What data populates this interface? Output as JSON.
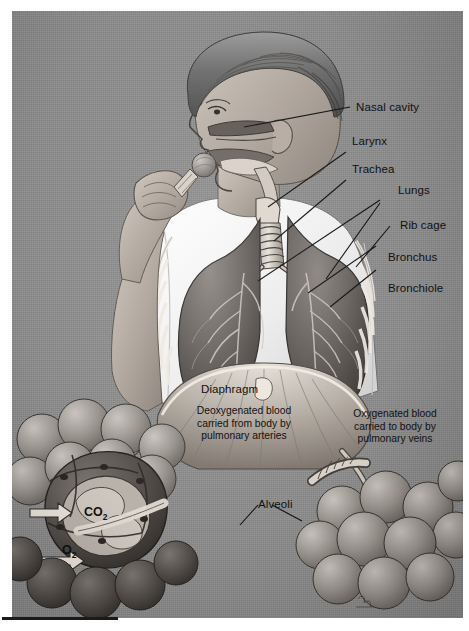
{
  "figure": {
    "background_color": "#8d8d8d",
    "ink_color": "#111111",
    "margin_color": "#ffffff"
  },
  "labels": [
    {
      "id": "nasal-cavity",
      "text": "Nasal cavity"
    },
    {
      "id": "larynx",
      "text": "Larynx"
    },
    {
      "id": "trachea",
      "text": "Trachea"
    },
    {
      "id": "lungs",
      "text": "Lungs"
    },
    {
      "id": "rib-cage",
      "text": "Rib cage"
    },
    {
      "id": "bronchus",
      "text": "Bronchus"
    },
    {
      "id": "bronchiole",
      "text": "Bronchiole"
    },
    {
      "id": "diaphragm",
      "text": "Diaphragm"
    },
    {
      "id": "alveoli",
      "text": "Alveoli"
    }
  ],
  "captions": {
    "deoxygenated": "Deoxygenated blood\ncarried from body by\npulmonary arteries",
    "oxygenated": "Oxygenated blood\ncarried to body by\npulmonary veins"
  },
  "gases": {
    "carbon_dioxide_symbol": "CO",
    "carbon_dioxide_subscript": "2",
    "oxygen_symbol": "O",
    "oxygen_subscript": "2"
  }
}
